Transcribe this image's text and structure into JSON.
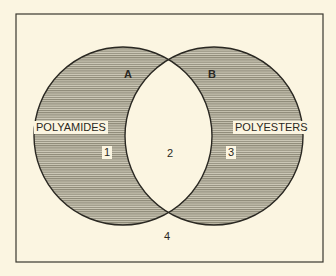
{
  "diagram": {
    "type": "venn",
    "sets": [
      {
        "id": "A",
        "label": "A",
        "name": "POLYAMIDES",
        "region": "1"
      },
      {
        "id": "B",
        "label": "B",
        "name": "POLYESTERS",
        "region": "3"
      }
    ],
    "regions": {
      "only_a": "1",
      "intersection": "2",
      "only_b": "3",
      "outside": "4"
    },
    "colors": {
      "background": "#fbf5e1",
      "hatch_dark": "#8a8675",
      "hatch_light": "#d2cebc",
      "stroke": "#2a2822"
    }
  }
}
